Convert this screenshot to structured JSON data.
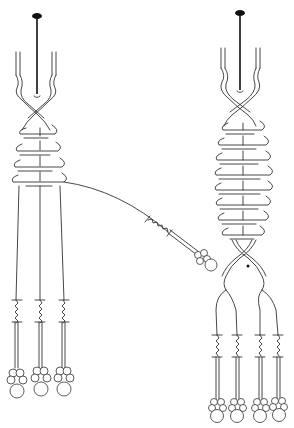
{
  "diagram": {
    "type": "line-art illustration",
    "background": "#ffffff",
    "stroke_color": "#333333",
    "left_figure": {
      "description": "braided cord with pin at top, wrapped section, three strands ending in bead clusters, one strand pulled out diagonally",
      "pin_x": 37,
      "pin_top": 16,
      "pin_bottom": 96,
      "wrap_rows": 4,
      "strand_count": 3,
      "pulled_strand": {
        "from": [
          62,
          182
        ],
        "to": [
          212,
          262
        ]
      }
    },
    "right_figure": {
      "description": "longer braided cord with pin at top, extended wrapped section, braid splitting into two pairs, four strands ending in bead clusters, small dot marker",
      "pin_x": 240,
      "pin_top": 14,
      "pin_bottom": 92,
      "wrap_rows": 8,
      "strand_count": 4,
      "marker_dot": [
        248,
        266
      ]
    }
  }
}
